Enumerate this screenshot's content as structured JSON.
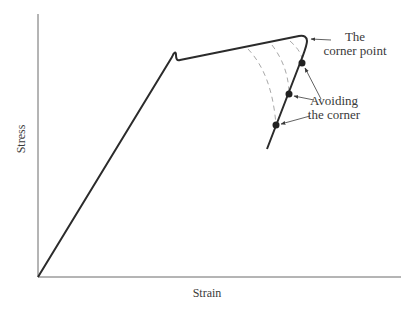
{
  "diagram": {
    "type": "stress-strain curve",
    "x_axis_label": "Strain",
    "y_axis_label": "Stress",
    "annotations": {
      "corner_line1": "The",
      "corner_line2": "corner point",
      "avoid_line1": "Avoiding",
      "avoid_line2": "the corner"
    },
    "colors": {
      "curve": "#2b2b2b",
      "axes": "#6a6a6a",
      "dashed": "#a8a8a8",
      "text": "#3a3a3a"
    },
    "points": {
      "marked_count": 3
    }
  }
}
